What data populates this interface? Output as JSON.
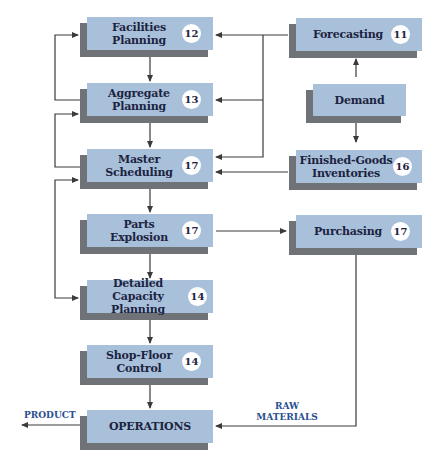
{
  "diagram": {
    "colors": {
      "box_face": "#a9c0da",
      "box_shadow": "#6f7276",
      "box_text": "#1b2340",
      "flow_label": "#2a4f8f",
      "connector": "#3a3a3a"
    },
    "boxes": {
      "facilities_planning": {
        "label": "Facilities Planning",
        "line1": "Facilities",
        "line2": "Planning",
        "badge": "12"
      },
      "aggregate_planning": {
        "label": "Aggregate Planning",
        "line1": "Aggregate",
        "line2": "Planning",
        "badge": "13"
      },
      "master_scheduling": {
        "label": "Master Scheduling",
        "line1": "Master",
        "line2": "Scheduling",
        "badge": "17"
      },
      "parts_explosion": {
        "label": "Parts Explosion",
        "line1": "Parts",
        "line2": "Explosion",
        "badge": "17"
      },
      "detailed_capacity_planning": {
        "label": "Detailed Capacity Planning",
        "line1": "Detailed",
        "line2": "Capacity Planning",
        "badge": "14"
      },
      "shop_floor_control": {
        "label": "Shop-Floor Control",
        "line1": "Shop-Floor",
        "line2": "Control",
        "badge": "14"
      },
      "operations": {
        "label": "OPERATIONS"
      },
      "forecasting": {
        "label": "Forecasting",
        "badge": "11"
      },
      "demand": {
        "label": "Demand"
      },
      "finished_goods_inventories": {
        "label": "Finished-Goods Inventories",
        "line1": "Finished-Goods",
        "line2": "Inventories",
        "badge": "16"
      },
      "purchasing": {
        "label": "Purchasing",
        "badge": "17"
      }
    },
    "flow_labels": {
      "product": "PRODUCT",
      "raw_materials_line1": "RAW",
      "raw_materials_line2": "MATERIALS"
    },
    "connections": [
      {
        "from": "Demand",
        "to": "Forecasting"
      },
      {
        "from": "Demand",
        "to": "Finished-Goods Inventories"
      },
      {
        "from": "Forecasting",
        "to": "Facilities Planning"
      },
      {
        "from": "Forecasting",
        "to": "Aggregate Planning"
      },
      {
        "from": "Forecasting",
        "to": "Master Scheduling"
      },
      {
        "from": "Finished-Goods Inventories",
        "to": "Master Scheduling"
      },
      {
        "from": "Facilities Planning",
        "to": "Aggregate Planning"
      },
      {
        "from": "Aggregate Planning",
        "to": "Master Scheduling"
      },
      {
        "from": "Master Scheduling",
        "to": "Parts Explosion"
      },
      {
        "from": "Parts Explosion",
        "to": "Detailed Capacity Planning"
      },
      {
        "from": "Parts Explosion",
        "to": "Purchasing"
      },
      {
        "from": "Detailed Capacity Planning",
        "to": "Shop-Floor Control"
      },
      {
        "from": "Shop-Floor Control",
        "to": "Operations"
      },
      {
        "from": "Purchasing",
        "to": "Operations",
        "label": "RAW MATERIALS"
      },
      {
        "from": "Operations",
        "to": "(out)",
        "label": "PRODUCT"
      },
      {
        "from": "Aggregate Planning",
        "to": "Facilities Planning",
        "type": "feedback"
      },
      {
        "from": "Master Scheduling",
        "to": "Aggregate Planning",
        "type": "feedback"
      },
      {
        "from": "Master Scheduling",
        "to": "Detailed Capacity Planning",
        "type": "feedback-bidirectional"
      }
    ]
  }
}
